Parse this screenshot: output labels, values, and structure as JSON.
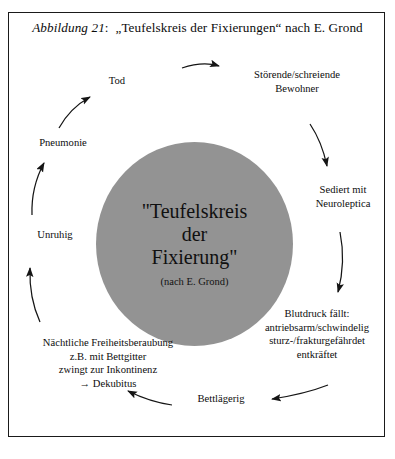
{
  "caption": {
    "figure_label": "Abbildung 21",
    "separator": ":",
    "title": "„Teufelskreis der Fixierungen“ nach E. Grond"
  },
  "center": {
    "line1": "\"Teufelskreis",
    "line2": "der",
    "line3": "Fixierung\"",
    "attribution": "(nach E. Grond)",
    "fill_color": "#939393"
  },
  "cycle": {
    "direction": "clockwise",
    "nodes": [
      {
        "id": "stoerende",
        "lines": [
          "Störende/schreiende",
          "Bewohner"
        ]
      },
      {
        "id": "sediert",
        "lines": [
          "Sediert mit",
          "Neuroleptica"
        ]
      },
      {
        "id": "blutdruck",
        "lines": [
          "Blutdruck fällt:",
          "antriebsarm/schwindelig",
          "sturz-/frakturgefährdet",
          "entkräftet"
        ]
      },
      {
        "id": "bettlaegerig",
        "lines": [
          "Bettlägerig"
        ]
      },
      {
        "id": "naechtliche",
        "lines": [
          "Nächtliche Freiheitsberaubung",
          "z.B. mit Bettgitter",
          "zwingt zur Inkontinenz",
          "→ Dekubitus"
        ]
      },
      {
        "id": "unruhig",
        "lines": [
          "Unruhig"
        ]
      },
      {
        "id": "pneumonie",
        "lines": [
          "Pneumonie"
        ]
      },
      {
        "id": "tod",
        "lines": [
          "Tod"
        ]
      }
    ]
  },
  "style": {
    "border_color": "#1a1a1a",
    "text_color": "#0d0d0d",
    "arrow_color": "#151515",
    "background": "#ffffff"
  }
}
